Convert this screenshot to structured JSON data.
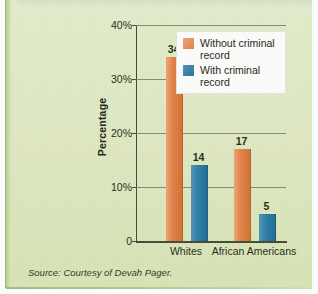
{
  "figure": {
    "title_fragment": "Discrimination in Hiring",
    "source_note": "Source: Courtesy of Devah Pager.",
    "colors": {
      "background": "#dfe8c2",
      "series_without_record": "#e07f45",
      "series_with_record": "#2b7ca6",
      "legend_background": "#fdfdfb",
      "axis": "#3f4a32",
      "gridline": "#6f7a5c",
      "accent_stripe": "#9dbd78"
    }
  },
  "chart_data": {
    "type": "bar",
    "title": "Discrimination in Hiring",
    "xlabel": "",
    "ylabel": "Percentage",
    "categories": [
      "Whites",
      "African Americans"
    ],
    "series": [
      {
        "name": "Without criminal record",
        "values": [
          34,
          17
        ]
      },
      {
        "name": "With criminal record",
        "values": [
          14,
          5
        ]
      }
    ],
    "note": "Within each category the first bar is 'Without criminal record' (orange) and the second bar is 'With criminal record' (blue). Whites: 34 without / 17 with. African Americans: 14 without / 5 with.",
    "bars": [
      {
        "category": "Whites",
        "series": "Without criminal record",
        "value": 34,
        "label": "34",
        "color": "#e07f45"
      },
      {
        "category": "Whites",
        "series": "With criminal record",
        "value": 17,
        "label": "17",
        "color": "#2b7ca6"
      },
      {
        "category": "African Americans",
        "series": "Without criminal record",
        "value": 14,
        "label": "14",
        "color": "#e07f45"
      },
      {
        "category": "African Americans",
        "series": "With criminal record",
        "value": 5,
        "label": "5",
        "color": "#2b7ca6"
      }
    ],
    "ylim": [
      0,
      40
    ],
    "yticks": [
      0,
      10,
      20,
      30,
      40
    ],
    "ytick_labels": [
      "0",
      "10%",
      "20%",
      "30%",
      "40%"
    ],
    "grid": true,
    "legend": {
      "position": "top-right",
      "entries": [
        {
          "label": "Without criminal record",
          "color": "#e07f45"
        },
        {
          "label": "With criminal record",
          "color": "#2b7ca6"
        }
      ]
    }
  }
}
